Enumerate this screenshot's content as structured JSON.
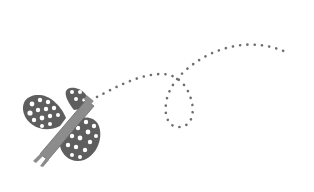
{
  "illustration": {
    "subject": "butterfly with dotted flight path",
    "colors": {
      "background": "#ffffff",
      "wing": "#5e5e5e",
      "wing_spots": "#ffffff",
      "body": "#8c8c8c",
      "body_outline": "#6a6a6a",
      "trail": "#6e6e6e"
    }
  }
}
